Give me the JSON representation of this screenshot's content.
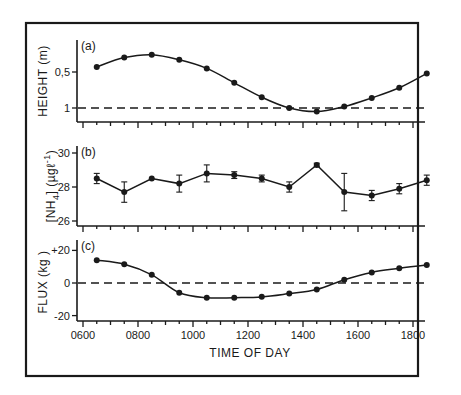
{
  "colors": {
    "ink": "#1a1a1a",
    "background": "#ffffff"
  },
  "xaxis": {
    "title": "TIME OF DAY",
    "ticks": [
      "0600",
      "0800",
      "1000",
      "1200",
      "1400",
      "1600",
      "1800"
    ]
  },
  "panels": [
    {
      "label": "(a)",
      "ylabel": "HEIGHT (m)",
      "yticks": [
        "0,5",
        "1"
      ]
    },
    {
      "label": "(b)",
      "ylabel": "[NH4] (µg l⁻¹)",
      "ylabel_main": "[NH",
      "ylabel_sub": "4",
      "ylabel_rest": "] (µgℓ",
      "ylabel_sup": "-1",
      "ylabel_close": ")",
      "yticks": [
        "30",
        "28",
        "26"
      ]
    },
    {
      "label": "(c)",
      "ylabel": "FLUX (kg )",
      "yticks": [
        "+20",
        "0",
        "-20"
      ]
    }
  ],
  "chart_data": [
    {
      "type": "line",
      "title": "(a)",
      "xlabel": "TIME OF DAY",
      "ylabel": "HEIGHT (m)",
      "x": [
        630,
        730,
        830,
        930,
        1030,
        1130,
        1230,
        1330,
        1430,
        1530,
        1630,
        1730,
        1830
      ],
      "y_tick_labels": [
        "0,5",
        "1"
      ],
      "series": [
        {
          "name": "Height",
          "values": [
            0.43,
            0.3,
            0.26,
            0.33,
            0.45,
            0.65,
            0.85,
            1.0,
            1.05,
            0.98,
            0.86,
            0.72,
            0.52
          ]
        }
      ],
      "reference_line": {
        "style": "dashed",
        "y": 1
      },
      "note": "axis inverted: 0.5 above 1"
    },
    {
      "type": "line",
      "title": "(b)",
      "xlabel": "TIME OF DAY",
      "ylabel": "[NH4] (µg l⁻¹)",
      "x": [
        630,
        730,
        830,
        930,
        1030,
        1130,
        1230,
        1330,
        1430,
        1530,
        1630,
        1730,
        1830
      ],
      "ylim": [
        26,
        30
      ],
      "series": [
        {
          "name": "NH4",
          "values": [
            28.5,
            27.7,
            28.5,
            28.2,
            28.8,
            28.7,
            28.5,
            28.0,
            29.3,
            27.7,
            27.5,
            27.9,
            28.4
          ],
          "errors": [
            0.3,
            0.6,
            0.0,
            0.5,
            0.5,
            0.2,
            0.2,
            0.3,
            0.1,
            1.1,
            0.3,
            0.3,
            0.3
          ]
        }
      ]
    },
    {
      "type": "line",
      "title": "(c)",
      "xlabel": "TIME OF DAY",
      "ylabel": "FLUX (kg )",
      "x": [
        630,
        730,
        830,
        930,
        1030,
        1130,
        1230,
        1330,
        1430,
        1530,
        1630,
        1730,
        1830
      ],
      "ylim": [
        -20,
        20
      ],
      "series": [
        {
          "name": "Flux",
          "values": [
            14,
            11.5,
            5,
            -6,
            -9,
            -9,
            -8.5,
            -6.5,
            -4,
            2,
            6.5,
            9,
            11
          ]
        }
      ],
      "reference_line": {
        "style": "dashed",
        "y": 0
      }
    }
  ]
}
